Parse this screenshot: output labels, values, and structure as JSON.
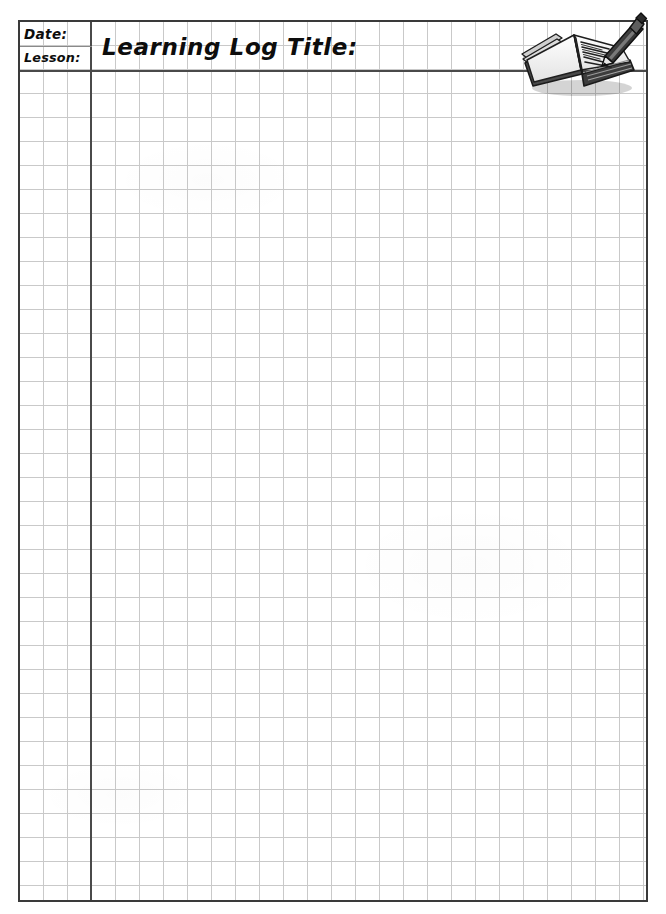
{
  "page": {
    "document_type": "learning-log-grid-worksheet",
    "background_color": "#ffffff",
    "width": 666,
    "height": 914
  },
  "header": {
    "date_label": "Date:",
    "lesson_label": "Lesson:",
    "title_label": "Learning Log Title:"
  },
  "illustration": {
    "name": "open-book-with-pencil-icon",
    "description": "open book with pencil writing on the page"
  },
  "grid": {
    "cell_size_px": 24,
    "line_color": "#c9c9c9",
    "border_color": "#3a3a3a",
    "heavy_rule_color": "#4a4a4a",
    "columns": 26,
    "rows": 36,
    "left_column_width_px": 72,
    "header_height_px": 50
  },
  "colors": {
    "ink": "#0d0d0d",
    "paper": "#ffffff",
    "grid_light": "#c9c9c9",
    "grid_heavy": "#4a4a4a"
  }
}
